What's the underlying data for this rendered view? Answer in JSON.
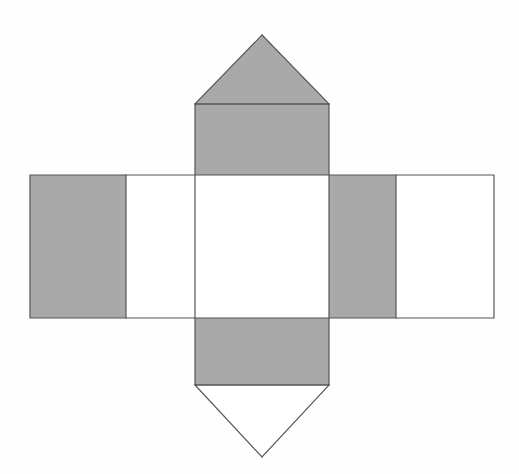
{
  "document": {
    "title": "Geometric Net Diagram",
    "width": 519,
    "height": 474,
    "background_color": "#FEFEFE"
  },
  "style": {
    "fill_gray": "#A9A9A9",
    "fill_white": "#FFFFFF",
    "stroke_color": "#555555",
    "stroke_width": 1.2
  },
  "figure": {
    "name": "prism-net",
    "faces": [
      {
        "id": "top-triangle-flap",
        "name": "top-triangle-flap",
        "kind": "triangle",
        "shaded": true,
        "fill": "#A9A9A9",
        "points": "195,104 262,35 329,104"
      },
      {
        "id": "upper-column-rect",
        "name": "upper-column-rectangle",
        "kind": "rectangle",
        "shaded": true,
        "fill": "#A9A9A9",
        "x": 195,
        "y": 104,
        "w": 134,
        "h": 71
      },
      {
        "id": "left-outer-rect-gray",
        "name": "left-outer-rectangle-shaded",
        "kind": "rectangle",
        "shaded": true,
        "fill": "#A9A9A9",
        "x": 30,
        "y": 175,
        "w": 96,
        "h": 143
      },
      {
        "id": "left-outer-rect-white",
        "name": "left-outer-rectangle-unshaded",
        "kind": "rectangle",
        "shaded": false,
        "fill": "#FFFFFF",
        "x": 126,
        "y": 175,
        "w": 69,
        "h": 143
      },
      {
        "id": "center-square",
        "name": "center-square",
        "kind": "rectangle",
        "shaded": false,
        "fill": "#FFFFFF",
        "x": 195,
        "y": 175,
        "w": 134,
        "h": 143
      },
      {
        "id": "right-inner-rect-gray",
        "name": "right-inner-rectangle-shaded",
        "kind": "rectangle",
        "shaded": true,
        "fill": "#A9A9A9",
        "x": 329,
        "y": 175,
        "w": 67,
        "h": 143
      },
      {
        "id": "right-outer-rect-white",
        "name": "right-outer-rectangle-unshaded",
        "kind": "rectangle",
        "shaded": false,
        "fill": "#FFFFFF",
        "x": 396,
        "y": 175,
        "w": 98,
        "h": 143
      },
      {
        "id": "lower-column-rect",
        "name": "lower-column-rectangle",
        "kind": "rectangle",
        "shaded": true,
        "fill": "#A9A9A9",
        "x": 195,
        "y": 318,
        "w": 134,
        "h": 67
      },
      {
        "id": "bottom-triangle-flap",
        "name": "bottom-triangle-flap",
        "kind": "triangle",
        "shaded": false,
        "fill": "#FFFFFF",
        "points": "195,385 329,385 262,457"
      }
    ],
    "edges": [
      {
        "id": "band-outline",
        "name": "horizontal-band-outline",
        "d": "M 30 175 L 494 175 L 494 318 L 30 318 Z"
      },
      {
        "id": "column-outline",
        "name": "vertical-column-outline",
        "d": "M 195 104 L 329 104 L 329 385 L 195 385 Z"
      },
      {
        "id": "divider-left",
        "name": "left-vertical-divider",
        "d": "M 126 175 L 126 318"
      },
      {
        "id": "divider-right",
        "name": "right-vertical-divider",
        "d": "M 396 175 L 396 318"
      },
      {
        "id": "fold-top",
        "name": "top-fold-line",
        "d": "M 195 104 L 329 104"
      },
      {
        "id": "fold-bottom",
        "name": "bottom-fold-line",
        "d": "M 195 385 L 329 385"
      },
      {
        "id": "tri-top-left",
        "name": "top-triangle-left-edge",
        "d": "M 195 104 L 262 35"
      },
      {
        "id": "tri-top-right",
        "name": "top-triangle-right-edge",
        "d": "M 262 35 L 329 104"
      },
      {
        "id": "tri-bot-left",
        "name": "bottom-triangle-left-edge",
        "d": "M 195 385 L 262 457"
      },
      {
        "id": "tri-bot-right",
        "name": "bottom-triangle-right-edge",
        "d": "M 262 457 L 329 385"
      }
    ]
  }
}
